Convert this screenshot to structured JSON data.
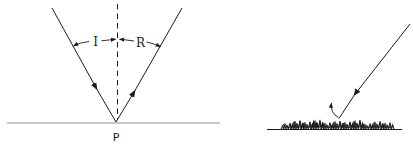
{
  "diagram": {
    "specular": {
      "incident_label": "I",
      "reflected_label": "R",
      "point_label": "P"
    },
    "diffuse": {}
  },
  "colors": {
    "ink": "#1a1a1a",
    "mirror_surface": "#909090",
    "background": "#ffffff"
  }
}
